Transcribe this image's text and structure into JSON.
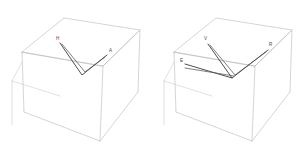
{
  "figure": {
    "type": "molecular-structure-pair",
    "background_color": "#ffffff",
    "box_edge_color": "#b9b9bd",
    "bond_color": "#3a3a3f",
    "label_color": "#4a4a50"
  },
  "panels": [
    {
      "id": "left",
      "name": "left-structure-panel",
      "bounding_box": {
        "name": "unit-cell-wireframe",
        "front_face": [
          {
            "x": 22,
            "y": 62
          },
          {
            "x": 64,
            "y": 38
          },
          {
            "x": 140,
            "y": 44
          },
          {
            "x": 103,
            "y": 72
          }
        ],
        "back_face": [
          {
            "x": 26,
            "y": 121
          },
          {
            "x": 68,
            "y": 12
          },
          {
            "x": 141,
            "y": 16
          },
          {
            "x": 103,
            "y": 148
          }
        ]
      },
      "atoms": [
        {
          "label": "H",
          "x": 58,
          "y": 40,
          "name": "atom-label-h"
        },
        {
          "label": "A",
          "x": 110,
          "y": 52,
          "name": "atom-label-a"
        }
      ],
      "bonds": [
        {
          "from": [
            60,
            43
          ],
          "to": [
            82,
            75
          ],
          "name": "bond-h-center"
        },
        {
          "from": [
            82,
            75
          ],
          "to": [
            107,
            55
          ],
          "name": "bond-center-a"
        },
        {
          "from": [
            62,
            44
          ],
          "to": [
            85,
            72
          ],
          "name": "bond-h-center-secondary"
        },
        {
          "from": [
            85,
            72
          ],
          "to": [
            105,
            57
          ],
          "name": "bond-center-a-secondary"
        }
      ]
    },
    {
      "id": "right",
      "name": "right-structure-panel",
      "bounding_box": {
        "name": "unit-cell-wireframe",
        "front_face": [
          {
            "x": 22,
            "y": 62
          },
          {
            "x": 64,
            "y": 38
          },
          {
            "x": 140,
            "y": 44
          },
          {
            "x": 103,
            "y": 72
          }
        ],
        "back_face": [
          {
            "x": 26,
            "y": 121
          },
          {
            "x": 68,
            "y": 12
          },
          {
            "x": 141,
            "y": 16
          },
          {
            "x": 103,
            "y": 148
          }
        ]
      },
      "atoms": [
        {
          "label": "V",
          "x": 54,
          "y": 40,
          "name": "atom-label-v"
        },
        {
          "label": "R",
          "x": 118,
          "y": 46,
          "name": "atom-label-r"
        },
        {
          "label": "E",
          "x": 30,
          "y": 62,
          "name": "atom-label-e"
        }
      ],
      "bonds": [
        {
          "from": [
            56,
            44
          ],
          "to": [
            80,
            78
          ],
          "name": "bond-v-center"
        },
        {
          "from": [
            80,
            78
          ],
          "to": [
            116,
            50
          ],
          "name": "bond-center-r"
        },
        {
          "from": [
            58,
            45
          ],
          "to": [
            83,
            75
          ],
          "name": "bond-v-center-secondary"
        },
        {
          "from": [
            83,
            75
          ],
          "to": [
            114,
            52
          ],
          "name": "bond-center-r-secondary"
        },
        {
          "from": [
            33,
            64
          ],
          "to": [
            80,
            78
          ],
          "name": "bond-e-center"
        },
        {
          "from": [
            33,
            68
          ],
          "to": [
            82,
            76
          ],
          "name": "bond-e-center-secondary"
        }
      ]
    }
  ]
}
